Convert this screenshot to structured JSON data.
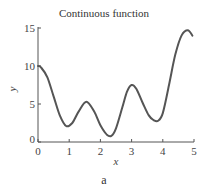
{
  "chart_data": {
    "type": "line",
    "title": "Continuous function",
    "xlabel": "x",
    "ylabel": "y",
    "caption": "a",
    "xlim": [
      0,
      5
    ],
    "ylim": [
      0,
      15
    ],
    "xticks": [
      "0",
      "1",
      "2",
      "3",
      "4",
      "5"
    ],
    "yticks": [
      "0",
      "5",
      "10",
      "15"
    ],
    "grid": false,
    "series": [
      {
        "name": "f(x)",
        "x": [
          0,
          0.1,
          0.3,
          0.5,
          0.7,
          0.9,
          1.1,
          1.3,
          1.55,
          1.8,
          2.0,
          2.2,
          2.35,
          2.5,
          2.7,
          2.85,
          3.0,
          3.15,
          3.35,
          3.55,
          3.7,
          3.85,
          4.0,
          4.2,
          4.4,
          4.6,
          4.8,
          4.95
        ],
        "y": [
          10,
          9.8,
          8.5,
          6.0,
          3.5,
          2.1,
          2.5,
          4.0,
          5.3,
          4.0,
          2.2,
          1.0,
          0.8,
          1.8,
          4.5,
          6.6,
          7.5,
          7.0,
          5.2,
          3.5,
          2.9,
          2.8,
          3.8,
          7.5,
          11.5,
          14.0,
          14.7,
          14.0
        ]
      }
    ]
  }
}
